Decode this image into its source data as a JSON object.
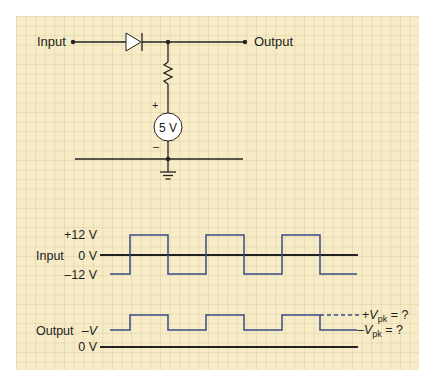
{
  "colors": {
    "paper": "#f7ecc5",
    "grid": "#c9bfa0",
    "wire": "#222222",
    "waveform": "#3a4a86",
    "source_fill": "#ffffff"
  },
  "circuit": {
    "input_label": "Input",
    "output_label": "Output",
    "source_label": "5 V",
    "source_plus": "+",
    "source_minus": "–",
    "components": [
      "diode",
      "resistor",
      "dc-source",
      "ground"
    ]
  },
  "input_waveform": {
    "row_label": "Input",
    "levels": [
      "+12 V",
      "0 V",
      "–12 V"
    ],
    "high_value_v": 12,
    "low_value_v": -12,
    "cycles": 3
  },
  "output_waveform": {
    "row_label": "Output",
    "level_label": "–V",
    "zero_label": "0 V",
    "pos_peak": {
      "sign": "+",
      "symbol": "V",
      "sub": "pk",
      "suffix": " = ?"
    },
    "neg_peak": {
      "sign": "–",
      "symbol": "V",
      "sub": "pk",
      "suffix": " = ?"
    },
    "cycles": 3
  }
}
